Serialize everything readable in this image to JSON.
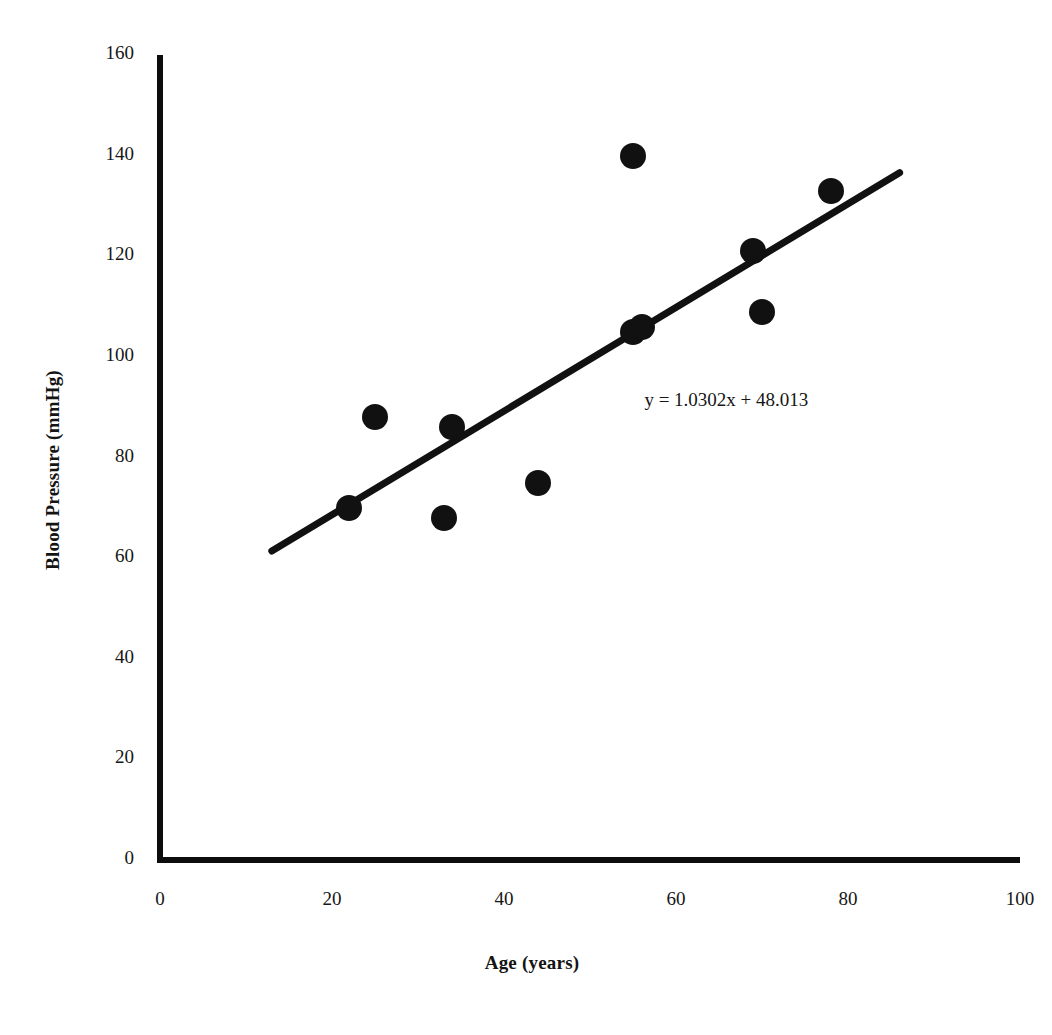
{
  "chart_data": {
    "type": "scatter",
    "title": "",
    "xlabel": "Age (years)",
    "ylabel": "Blood Pressure (mmHg)",
    "xlim": [
      0,
      100
    ],
    "ylim": [
      0,
      160
    ],
    "xticks": [
      0,
      20,
      40,
      60,
      80,
      100
    ],
    "yticks": [
      0,
      20,
      40,
      60,
      80,
      100,
      120,
      140,
      160
    ],
    "grid": false,
    "legend": null,
    "marker_color": "#111111",
    "series": [
      {
        "name": "Observations",
        "points": [
          {
            "x": 22,
            "y": 70
          },
          {
            "x": 25,
            "y": 88
          },
          {
            "x": 33,
            "y": 68
          },
          {
            "x": 34,
            "y": 86
          },
          {
            "x": 44,
            "y": 75
          },
          {
            "x": 55,
            "y": 140
          },
          {
            "x": 55,
            "y": 105
          },
          {
            "x": 56,
            "y": 106
          },
          {
            "x": 69,
            "y": 121
          },
          {
            "x": 70,
            "y": 109
          },
          {
            "x": 78,
            "y": 133
          }
        ]
      }
    ],
    "trendline": {
      "equation": "y = 1.0302x + 48.013",
      "slope": 1.0302,
      "intercept": 48.013,
      "x_start": 13,
      "x_end": 86,
      "color": "#111111"
    },
    "annotations": [
      {
        "text": "y = 1.0302x + 48.013",
        "x": 64,
        "y": 91
      }
    ]
  }
}
